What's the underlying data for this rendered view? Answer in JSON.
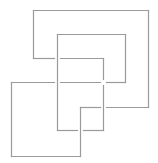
{
  "diagram": {
    "title": "",
    "line_color": "#9a9a9a",
    "background": "#ffffff",
    "shapes": [
      {
        "id": "outer-frame",
        "segments": [
          [
            [
              33,
              10
            ],
            [
              148,
              10
            ]
          ],
          [
            [
              148,
              10
            ],
            [
              148,
              107
            ]
          ],
          [
            [
              148,
              107
            ],
            [
              106,
              107
            ]
          ],
          [
            [
              33,
              10
            ],
            [
              33,
              58
            ]
          ],
          [
            [
              33,
              58
            ],
            [
              54,
              58
            ]
          ],
          [
            [
              60,
              58
            ],
            [
              103,
              58
            ]
          ],
          [
            [
              103,
              58
            ],
            [
              103,
              79
            ]
          ],
          [
            [
              103,
              85
            ],
            [
              103,
              130
            ]
          ]
        ]
      },
      {
        "id": "middle-frame",
        "segments": [
          [
            [
              57,
              34
            ],
            [
              125,
              34
            ]
          ],
          [
            [
              125,
              34
            ],
            [
              125,
              82
            ]
          ],
          [
            [
              125,
              82
            ],
            [
              106,
              82
            ]
          ],
          [
            [
              57,
              34
            ],
            [
              57,
              130
            ]
          ],
          [
            [
              57,
              130
            ],
            [
              77,
              130
            ]
          ],
          [
            [
              83,
              130
            ],
            [
              103,
              130
            ]
          ]
        ]
      },
      {
        "id": "lower-frame",
        "segments": [
          [
            [
              11,
              82
            ],
            [
              54,
              82
            ]
          ],
          [
            [
              60,
              82
            ],
            [
              100,
              82
            ]
          ],
          [
            [
              11,
              82
            ],
            [
              11,
              156
            ]
          ],
          [
            [
              11,
              156
            ],
            [
              80,
              156
            ]
          ],
          [
            [
              80,
              156
            ],
            [
              80,
              107
            ]
          ],
          [
            [
              80,
              107
            ],
            [
              100,
              107
            ]
          ]
        ]
      }
    ]
  }
}
